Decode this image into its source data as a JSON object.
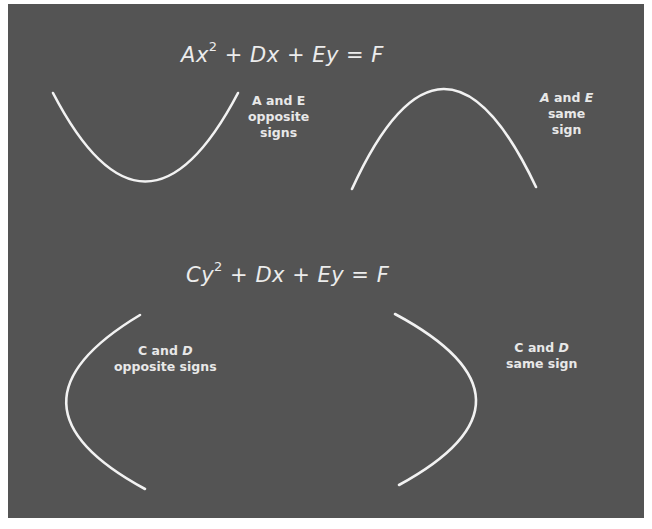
{
  "figure": {
    "background_color": "#545454",
    "curve_color": "#f2f2f2",
    "top_section": {
      "equation": {
        "coef1": "A",
        "var1": "x",
        "exp": "2",
        "plus1": "+",
        "term2": "Dx",
        "plus2": "+",
        "term3": "Ey",
        "equals": "=",
        "rhs": "F"
      },
      "left_curve": {
        "shape": "parabola-opening-up",
        "label_line1_a": "A",
        "label_line1_and": "and",
        "label_line1_b": "E",
        "label_line2": "opposite",
        "label_line3": "signs"
      },
      "right_curve": {
        "shape": "parabola-opening-down",
        "label_line1_a": "A",
        "label_line1_and": "and",
        "label_line1_b": "E",
        "label_line2": "same",
        "label_line3": "sign"
      }
    },
    "bottom_section": {
      "equation": {
        "coef1": "C",
        "var1": "y",
        "exp": "2",
        "plus1": "+",
        "term2": "Dx",
        "plus2": "+",
        "term3": "Ey",
        "equals": "=",
        "rhs": "F"
      },
      "left_curve": {
        "shape": "parabola-opening-right",
        "label_line1_a": "C",
        "label_line1_and": "and",
        "label_line1_b": "D",
        "label_line2": "opposite signs"
      },
      "right_curve": {
        "shape": "parabola-opening-left",
        "label_line1_a": "C",
        "label_line1_and": "and",
        "label_line1_b": "D",
        "label_line2": "same sign"
      }
    }
  }
}
